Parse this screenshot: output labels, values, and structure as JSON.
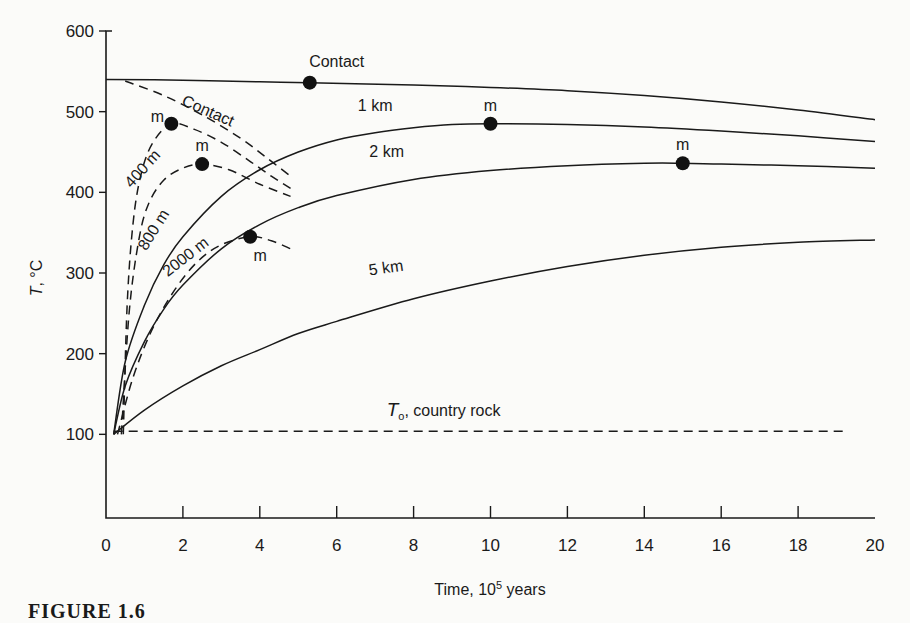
{
  "figure": {
    "caption": "FIGURE 1.6"
  },
  "chart_data": {
    "type": "line",
    "title": "",
    "xlabel": "Time, 10^5 years",
    "xlabel_main": "Time, 10",
    "xlabel_sup": "5",
    "xlabel_tail": " years",
    "ylabel": "T, °C",
    "xlim": [
      0,
      20
    ],
    "ylim": [
      0,
      600
    ],
    "xticks": [
      0,
      2,
      4,
      6,
      8,
      10,
      12,
      14,
      16,
      18,
      20
    ],
    "yticks": [
      100,
      200,
      300,
      400,
      500,
      600
    ],
    "grid": false,
    "legend": "inline labels",
    "reference_line": {
      "label": "T₀, country rock",
      "label_T": "T",
      "label_sub": "o",
      "label_rest": ", country rock",
      "y": 100,
      "x_range": [
        0.2,
        19.2
      ],
      "style": "dashed"
    },
    "series": [
      {
        "name": "Contact",
        "label": "Contact",
        "style": "solid",
        "depth": "contact",
        "x": [
          0,
          2,
          4,
          5.3,
          8,
          10,
          12,
          14,
          16,
          18,
          20
        ],
        "y": [
          540,
          539,
          537,
          536,
          533,
          530,
          526,
          520,
          512,
          502,
          490
        ],
        "max": {
          "x": 5.3,
          "y": 536,
          "marker": "dot"
        }
      },
      {
        "name": "1 km",
        "label": "1 km",
        "style": "solid",
        "depth": "1 km",
        "x": [
          0.2,
          0.5,
          1,
          1.5,
          2,
          3,
          4,
          5,
          6,
          7,
          8,
          9,
          10,
          12,
          14,
          16,
          18,
          20
        ],
        "y": [
          100,
          190,
          260,
          310,
          345,
          395,
          428,
          450,
          465,
          474,
          480,
          484,
          485,
          484,
          481,
          476,
          470,
          463
        ],
        "max": {
          "x": 10,
          "y": 485,
          "marker": "dot",
          "label": "m"
        }
      },
      {
        "name": "2 km",
        "label": "2 km",
        "style": "solid",
        "depth": "2 km",
        "x": [
          0.2,
          0.5,
          1,
          1.5,
          2,
          3,
          4,
          5,
          6,
          8,
          10,
          12,
          14,
          15,
          16,
          18,
          20
        ],
        "y": [
          100,
          160,
          215,
          255,
          285,
          330,
          360,
          381,
          396,
          416,
          427,
          433,
          436,
          436,
          435,
          433,
          430
        ],
        "max": {
          "x": 15,
          "y": 436,
          "marker": "dot",
          "label": "m"
        }
      },
      {
        "name": "5 km",
        "label": "5 km",
        "style": "solid",
        "depth": "5 km",
        "x": [
          0.2,
          1,
          2,
          3,
          4,
          5,
          6,
          8,
          10,
          12,
          14,
          16,
          18,
          20
        ],
        "y": [
          100,
          130,
          160,
          185,
          205,
          225,
          240,
          268,
          290,
          308,
          322,
          332,
          338,
          341
        ]
      },
      {
        "name": "Contact (dashed)",
        "label": "Contact",
        "style": "dashed",
        "depth": "contact",
        "x": [
          0.5,
          1.5,
          2.5,
          3.5,
          4.2,
          4.8
        ],
        "y": [
          538,
          520,
          496,
          467,
          442,
          420
        ]
      },
      {
        "name": "400 m",
        "label": "400 m",
        "style": "dashed",
        "depth": "400 m",
        "x": [
          0.45,
          0.55,
          0.7,
          0.9,
          1.2,
          1.7,
          2.3,
          3.0,
          3.7,
          4.3,
          4.8
        ],
        "y": [
          100,
          260,
          360,
          420,
          460,
          485,
          478,
          462,
          440,
          420,
          405
        ],
        "max": {
          "x": 1.7,
          "y": 485,
          "marker": "dot",
          "label": "m"
        }
      },
      {
        "name": "800 m",
        "label": "800 m",
        "style": "dashed",
        "depth": "800 m",
        "x": [
          0.4,
          0.6,
          0.85,
          1.1,
          1.5,
          2.0,
          2.5,
          3.2,
          4.0,
          4.8
        ],
        "y": [
          100,
          250,
          340,
          385,
          415,
          430,
          435,
          428,
          410,
          395
        ],
        "max": {
          "x": 2.5,
          "y": 435,
          "marker": "dot",
          "label": "m"
        }
      },
      {
        "name": "2000 m",
        "label": "2000 m",
        "style": "dashed",
        "depth": "2000 m",
        "x": [
          0.3,
          0.7,
          1.2,
          1.8,
          2.4,
          3.0,
          3.75,
          4.3,
          4.8
        ],
        "y": [
          100,
          170,
          230,
          280,
          315,
          335,
          345,
          340,
          330
        ],
        "max": {
          "x": 3.75,
          "y": 345,
          "marker": "dot",
          "label": "m"
        }
      }
    ],
    "annotations": [
      {
        "text": "Contact",
        "x": 6.0,
        "y": 555,
        "rotate": 0
      },
      {
        "text": "1 km",
        "x": 7.0,
        "y": 501,
        "rotate": 0
      },
      {
        "text": "2 km",
        "x": 7.3,
        "y": 444,
        "rotate": 0
      },
      {
        "text": "5 km",
        "x": 7.3,
        "y": 300,
        "rotate": -8
      },
      {
        "text": "Contact",
        "x": 2.6,
        "y": 495,
        "rotate": 24
      },
      {
        "text": "400 m",
        "x": 1.05,
        "y": 425,
        "rotate": -48
      },
      {
        "text": "800 m",
        "x": 1.35,
        "y": 350,
        "rotate": -58
      },
      {
        "text": "2000 m",
        "x": 2.15,
        "y": 315,
        "rotate": -38
      }
    ],
    "marker_label": "m"
  }
}
